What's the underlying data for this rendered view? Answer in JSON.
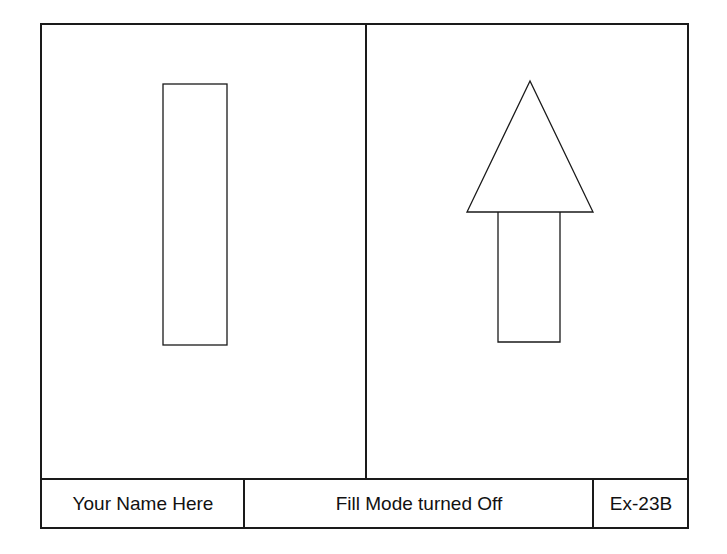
{
  "title_block": {
    "name": "Your Name Here",
    "description": "Fill Mode turned Off",
    "exercise_id": "Ex-23B"
  },
  "drawing": {
    "stroke_color": "#1a1a1a",
    "background": "#ffffff",
    "left_view": {
      "shape": "rectangle",
      "x": 163,
      "y": 84,
      "width": 64,
      "height": 261
    },
    "right_view": {
      "shape": "arrow-up",
      "triangle": {
        "apex": [
          530,
          81
        ],
        "base_left": [
          467,
          212
        ],
        "base_right": [
          593,
          212
        ]
      },
      "stem": {
        "x": 498,
        "y": 212,
        "width": 62,
        "height": 130
      }
    }
  }
}
